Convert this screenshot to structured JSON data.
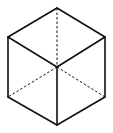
{
  "diagram": {
    "title": "",
    "type": "wireframe-cube",
    "colors": {
      "stroke": "#111111",
      "background": "#ffffff"
    },
    "vertices": {
      "top": [
        57,
        8
      ],
      "upper_left": [
        8,
        37
      ],
      "upper_right": [
        105,
        37
      ],
      "center": [
        57,
        67
      ],
      "lower_left": [
        8,
        97
      ],
      "lower_right": [
        105,
        97
      ],
      "bottom": [
        57,
        125
      ]
    },
    "solid_edges": [
      [
        "top",
        "upper_left"
      ],
      [
        "top",
        "upper_right"
      ],
      [
        "upper_left",
        "center"
      ],
      [
        "upper_right",
        "center"
      ],
      [
        "upper_left",
        "lower_left"
      ],
      [
        "upper_right",
        "lower_right"
      ],
      [
        "center",
        "bottom"
      ],
      [
        "lower_left",
        "bottom"
      ],
      [
        "lower_right",
        "bottom"
      ]
    ],
    "dashed_edges": [
      [
        "top",
        "center"
      ],
      [
        "center",
        "lower_left"
      ],
      [
        "center",
        "lower_right"
      ]
    ]
  }
}
